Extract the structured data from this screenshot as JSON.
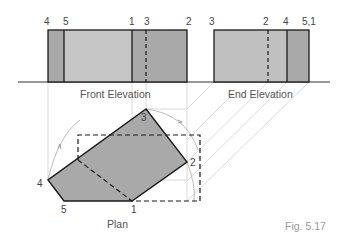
{
  "figure": {
    "caption": "Fig. 5.17",
    "views": {
      "front": {
        "label": "Front Elevation",
        "point_labels": [
          "4",
          "5",
          "1",
          "3",
          "2"
        ]
      },
      "end": {
        "label": "End Elevation",
        "point_labels": [
          "3",
          "2",
          "4",
          "5,1"
        ]
      },
      "plan": {
        "label": "Plan",
        "point_labels": [
          "3",
          "2",
          "1",
          "5",
          "4"
        ]
      }
    },
    "colors": {
      "dark_fill": "#a9a9a9",
      "light_fill": "#c4c4c4",
      "outline": "#1a1a1a",
      "construction": "#c8c8c8",
      "label": "#555555"
    }
  }
}
